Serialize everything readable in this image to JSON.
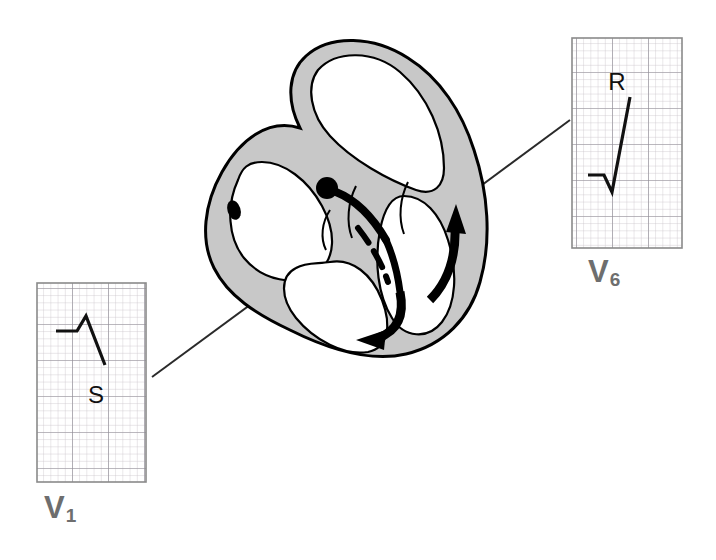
{
  "figure": {
    "type": "anatomical-diagram",
    "background_color": "#ffffff"
  },
  "colors": {
    "myocardium_gray": "#c8c8c8",
    "outline_black": "#000000",
    "chamber_white": "#ffffff",
    "ecg_grid_minor": "#c9c2c9",
    "ecg_grid_major": "#8d8a93",
    "ecg_panel_border": "#8a8a8a",
    "ecg_trace": "#111111",
    "label_gray": "#6e6e6e",
    "connector_line": "#2a2a2a"
  },
  "heart": {
    "name": "heart-cross-section",
    "description": "Four-chamber coronal cross-section of the heart with gray myocardial walls, white chambers, conduction system and depolarization arrows",
    "structures": [
      {
        "name": "right-atrium",
        "label": ""
      },
      {
        "name": "left-atrium",
        "label": ""
      },
      {
        "name": "right-ventricle",
        "label": ""
      },
      {
        "name": "left-ventricle",
        "label": ""
      },
      {
        "name": "interventricular-septum",
        "label": ""
      },
      {
        "name": "sinoatrial-node",
        "label": "",
        "shape": "small black oval"
      },
      {
        "name": "atrioventricular-node",
        "label": "",
        "shape": "black filled circle"
      },
      {
        "name": "bundle-of-his",
        "label": "",
        "shape": "thick black line down septum"
      },
      {
        "name": "left-bundle-branch",
        "label": ""
      },
      {
        "name": "right-bundle-branch",
        "label": ""
      }
    ],
    "arrows": [
      {
        "name": "septal-depolarization-arrow",
        "direction": "down-left toward apex"
      },
      {
        "name": "free-wall-depolarization-arrow",
        "direction": "upward along left ventricular wall"
      }
    ]
  },
  "ecg_panels": [
    {
      "name": "v1-panel",
      "lead": "V",
      "subscript": "1",
      "label": "V1",
      "wave_label": "S",
      "wave_description": "small initial r wave followed by a deep negative S wave",
      "grid": {
        "minor_squares_x": 20,
        "minor_squares_y": 40,
        "major_every": 5
      }
    },
    {
      "name": "v6-panel",
      "lead": "V",
      "subscript": "6",
      "label": "V6",
      "wave_label": "R",
      "wave_description": "small q dip followed by a tall positive R wave",
      "grid": {
        "minor_squares_x": 20,
        "minor_squares_y": 35,
        "major_every": 5
      }
    }
  ],
  "connectors": [
    {
      "name": "connector-v1-to-heart",
      "from": "v1-panel",
      "to": "heart-apex-left"
    },
    {
      "name": "connector-v6-to-heart",
      "from": "v6-panel",
      "to": "heart-left-wall"
    }
  ]
}
